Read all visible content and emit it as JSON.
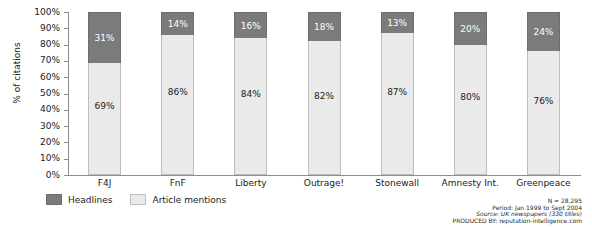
{
  "chart_data": {
    "type": "bar",
    "stacked": true,
    "stack_mode": "percent",
    "title": "",
    "xlabel": "",
    "ylabel": "% of citations",
    "ylim": [
      0,
      100
    ],
    "ytick_labels": [
      "100%",
      "90%",
      "80%",
      "70%",
      "60%",
      "50%",
      "40%",
      "30%",
      "20%",
      "10%",
      "0%"
    ],
    "ytick_values": [
      100,
      90,
      80,
      70,
      60,
      50,
      40,
      30,
      20,
      10,
      0
    ],
    "grid": false,
    "legend_position": "bottom-left",
    "categories": [
      "F4J",
      "FnF",
      "Liberty",
      "Outrage!",
      "Stonewall",
      "Amnesty Int.",
      "Greenpeace"
    ],
    "series": [
      {
        "name": "Headlines",
        "color": "#7b7b7b",
        "values": [
          31,
          14,
          16,
          18,
          13,
          20,
          24
        ],
        "labels": [
          "31%",
          "14%",
          "16%",
          "18%",
          "13%",
          "20%",
          "24%"
        ]
      },
      {
        "name": "Article mentions",
        "color": "#eaeaea",
        "values": [
          69,
          86,
          84,
          82,
          87,
          80,
          76
        ],
        "labels": [
          "69%",
          "86%",
          "84%",
          "82%",
          "87%",
          "80%",
          "76%"
        ]
      }
    ]
  },
  "legend": {
    "items": [
      {
        "label": "Headlines",
        "color": "#7b7b7b"
      },
      {
        "label": "Article mentions",
        "color": "#eaeaea"
      }
    ]
  },
  "footnote": {
    "line1": "N = 28,295",
    "line2": "Period: Jan 1999 to Sept 2004",
    "line3": "Source: UK newspapers (330 titles)",
    "line4": "PRODUCED BY: reputation-intelligence.com"
  }
}
